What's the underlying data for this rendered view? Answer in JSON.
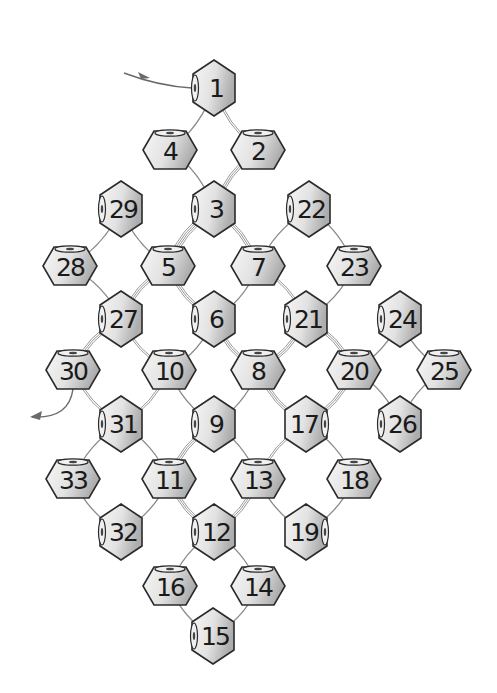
{
  "diagram": {
    "type": "beading-pattern",
    "colors": {
      "bead_light": "#f4f4f4",
      "bead_dark": "#b5b5b5",
      "stroke": "#2a2a2a",
      "thread": "#8a8a8a",
      "background": "#ffffff"
    },
    "entry_arrow": {
      "from": [
        124,
        73
      ],
      "to": [
        192,
        88
      ]
    },
    "exit_arrow": {
      "from": [
        73,
        389
      ],
      "to": [
        32,
        417
      ]
    },
    "beads": [
      {
        "n": "1",
        "x": 214,
        "y": 88,
        "orient": "vertical",
        "hole": "left"
      },
      {
        "n": "2",
        "x": 258,
        "y": 150,
        "orient": "horizontal",
        "hole": "top"
      },
      {
        "n": "3",
        "x": 214,
        "y": 209,
        "orient": "vertical",
        "hole": "left"
      },
      {
        "n": "4",
        "x": 170,
        "y": 150,
        "orient": "horizontal",
        "hole": "top"
      },
      {
        "n": "5",
        "x": 168,
        "y": 266,
        "orient": "horizontal",
        "hole": "top"
      },
      {
        "n": "6",
        "x": 214,
        "y": 319,
        "orient": "vertical",
        "hole": "left"
      },
      {
        "n": "7",
        "x": 258,
        "y": 266,
        "orient": "horizontal",
        "hole": "top"
      },
      {
        "n": "8",
        "x": 258,
        "y": 370,
        "orient": "horizontal",
        "hole": "top"
      },
      {
        "n": "9",
        "x": 214,
        "y": 424,
        "orient": "vertical",
        "hole": "left"
      },
      {
        "n": "10",
        "x": 169,
        "y": 370,
        "orient": "horizontal",
        "hole": "top"
      },
      {
        "n": "11",
        "x": 169,
        "y": 479,
        "orient": "horizontal",
        "hole": "top"
      },
      {
        "n": "12",
        "x": 214,
        "y": 532,
        "orient": "vertical",
        "hole": "left"
      },
      {
        "n": "13",
        "x": 258,
        "y": 479,
        "orient": "horizontal",
        "hole": "top"
      },
      {
        "n": "14",
        "x": 258,
        "y": 586,
        "orient": "horizontal",
        "hole": "top"
      },
      {
        "n": "15",
        "x": 213,
        "y": 636,
        "orient": "vertical",
        "hole": "left"
      },
      {
        "n": "16",
        "x": 170,
        "y": 586,
        "orient": "horizontal",
        "hole": "top"
      },
      {
        "n": "17",
        "x": 306,
        "y": 424,
        "orient": "vertical",
        "hole": "right"
      },
      {
        "n": "18",
        "x": 354,
        "y": 479,
        "orient": "horizontal",
        "hole": "top"
      },
      {
        "n": "19",
        "x": 306,
        "y": 532,
        "orient": "vertical",
        "hole": "right"
      },
      {
        "n": "20",
        "x": 354,
        "y": 370,
        "orient": "horizontal",
        "hole": "top"
      },
      {
        "n": "21",
        "x": 306,
        "y": 319,
        "orient": "vertical",
        "hole": "left"
      },
      {
        "n": "22",
        "x": 309,
        "y": 209,
        "orient": "vertical",
        "hole": "left"
      },
      {
        "n": "23",
        "x": 354,
        "y": 266,
        "orient": "horizontal",
        "hole": "top"
      },
      {
        "n": "24",
        "x": 400,
        "y": 319,
        "orient": "vertical",
        "hole": "left"
      },
      {
        "n": "25",
        "x": 444,
        "y": 370,
        "orient": "horizontal",
        "hole": "top"
      },
      {
        "n": "26",
        "x": 400,
        "y": 424,
        "orient": "vertical",
        "hole": "left"
      },
      {
        "n": "27",
        "x": 121,
        "y": 319,
        "orient": "vertical",
        "hole": "left"
      },
      {
        "n": "28",
        "x": 70,
        "y": 266,
        "orient": "horizontal",
        "hole": "top"
      },
      {
        "n": "29",
        "x": 121,
        "y": 209,
        "orient": "vertical",
        "hole": "left"
      },
      {
        "n": "30",
        "x": 73,
        "y": 370,
        "orient": "horizontal",
        "hole": "top"
      },
      {
        "n": "31",
        "x": 121,
        "y": 424,
        "orient": "vertical",
        "hole": "left"
      },
      {
        "n": "32",
        "x": 121,
        "y": 532,
        "orient": "vertical",
        "hole": "left"
      },
      {
        "n": "33",
        "x": 73,
        "y": 479,
        "orient": "horizontal",
        "hole": "top"
      }
    ],
    "threads": [
      [
        "1",
        "2",
        2
      ],
      [
        "2",
        "3",
        3
      ],
      [
        "3",
        "4",
        1
      ],
      [
        "4",
        "1",
        1
      ],
      [
        "3",
        "5",
        4
      ],
      [
        "5",
        "6",
        3
      ],
      [
        "6",
        "7",
        1
      ],
      [
        "7",
        "3",
        3
      ],
      [
        "5",
        "27",
        3
      ],
      [
        "27",
        "10",
        2
      ],
      [
        "10",
        "6",
        1
      ],
      [
        "6",
        "8",
        3
      ],
      [
        "8",
        "21",
        3
      ],
      [
        "21",
        "7",
        2
      ],
      [
        "27",
        "28",
        1
      ],
      [
        "28",
        "29",
        1
      ],
      [
        "29",
        "5",
        1
      ],
      [
        "27",
        "30",
        3
      ],
      [
        "30",
        "31",
        2
      ],
      [
        "31",
        "10",
        2
      ],
      [
        "10",
        "9",
        1
      ],
      [
        "9",
        "8",
        1
      ],
      [
        "8",
        "17",
        3
      ],
      [
        "17",
        "13",
        2
      ],
      [
        "13",
        "9",
        1
      ],
      [
        "9",
        "11",
        3
      ],
      [
        "11",
        "31",
        1
      ],
      [
        "31",
        "33",
        1
      ],
      [
        "33",
        "32",
        1
      ],
      [
        "32",
        "11",
        1
      ],
      [
        "11",
        "12",
        3
      ],
      [
        "12",
        "13",
        3
      ],
      [
        "13",
        "19",
        1
      ],
      [
        "19",
        "18",
        1
      ],
      [
        "18",
        "17",
        1
      ],
      [
        "17",
        "20",
        3
      ],
      [
        "20",
        "21",
        3
      ],
      [
        "21",
        "23",
        1
      ],
      [
        "23",
        "22",
        1
      ],
      [
        "22",
        "7",
        1
      ],
      [
        "20",
        "24",
        1
      ],
      [
        "24",
        "25",
        1
      ],
      [
        "25",
        "26",
        1
      ],
      [
        "26",
        "20",
        1
      ],
      [
        "12",
        "16",
        1
      ],
      [
        "16",
        "15",
        1
      ],
      [
        "15",
        "14",
        1
      ],
      [
        "14",
        "12",
        1
      ]
    ]
  }
}
